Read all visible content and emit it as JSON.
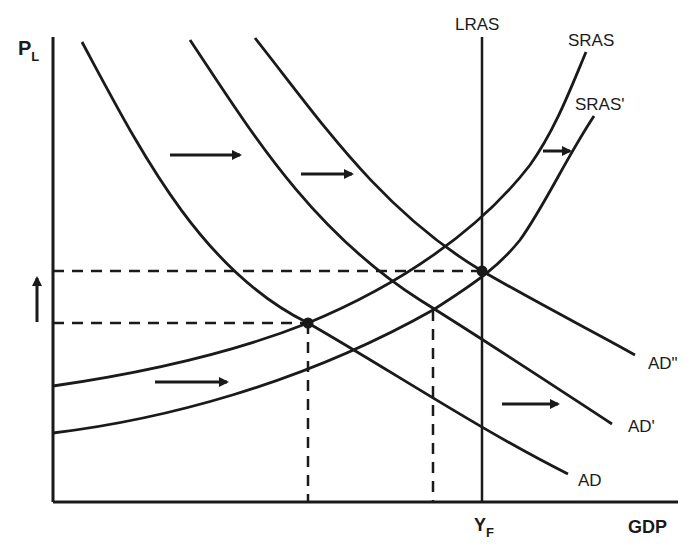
{
  "diagram": {
    "type": "AD-AS model",
    "axes": {
      "y_label": "P",
      "y_label_sub": "L",
      "x_label": "GDP",
      "x_tick_label": "Y",
      "x_tick_label_sub": "F"
    },
    "curves": {
      "lras": "LRAS",
      "sras": "SRAS",
      "sras_shifted": "SRAS'",
      "ad": "AD",
      "ad_shifted": "AD'",
      "ad_shifted_twice": "AD\""
    },
    "shift_arrows": [
      {
        "direction": "right",
        "meaning": "AD to AD'"
      },
      {
        "direction": "right",
        "meaning": "AD' to AD\""
      },
      {
        "direction": "right",
        "meaning": "SRAS to SRAS'"
      },
      {
        "direction": "right",
        "meaning": "SRAS' upper arrow"
      },
      {
        "direction": "right",
        "meaning": "AD lower arrow"
      },
      {
        "direction": "up",
        "meaning": "price level rise"
      }
    ],
    "equilibria": [
      {
        "name": "initial",
        "curves": [
          "AD",
          "SRAS"
        ]
      },
      {
        "name": "final",
        "curves": [
          "AD\"",
          "SRAS'",
          "LRAS"
        ]
      }
    ],
    "colors": {
      "ink": "#1a1a1a",
      "background": "#ffffff"
    }
  }
}
